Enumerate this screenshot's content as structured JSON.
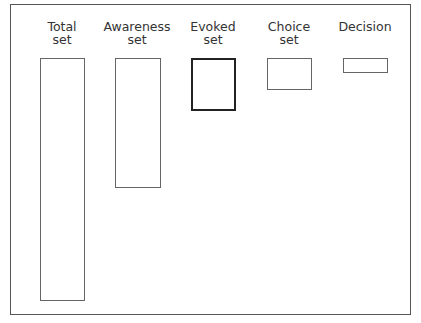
{
  "diagram": {
    "title": "",
    "stages": [
      {
        "label_line1": "Total",
        "label_line2": "set",
        "relative_size": 1.0,
        "emphasized": false
      },
      {
        "label_line1": "Awareness",
        "label_line2": "set",
        "relative_size": 0.53,
        "emphasized": false
      },
      {
        "label_line1": "Evoked",
        "label_line2": "set",
        "relative_size": 0.21,
        "emphasized": true
      },
      {
        "label_line1": "Choice",
        "label_line2": "set",
        "relative_size": 0.13,
        "emphasized": false
      },
      {
        "label_line1": "Decision",
        "label_line2": "",
        "relative_size": 0.06,
        "emphasized": false
      }
    ]
  }
}
